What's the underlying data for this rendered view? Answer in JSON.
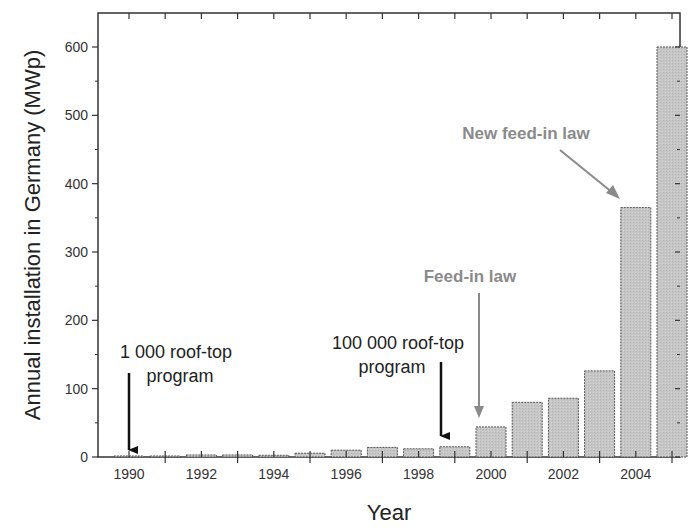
{
  "chart_data": {
    "type": "bar",
    "title": "",
    "xlabel": "Year",
    "ylabel": "Annual installation in Germany (MWp)",
    "categories": [
      "1990",
      "1991",
      "1992",
      "1993",
      "1994",
      "1995",
      "1996",
      "1997",
      "1998",
      "1999",
      "2000",
      "2001",
      "2002",
      "2003",
      "2004",
      "2005"
    ],
    "values": [
      0.5,
      1.5,
      3,
      3,
      2.5,
      5.5,
      10,
      14,
      12,
      15,
      44,
      80,
      86,
      126,
      365,
      600
    ],
    "xticks": [
      "1990",
      "1992",
      "1994",
      "1996",
      "1998",
      "2000",
      "2002",
      "2004"
    ],
    "yticks": [
      0,
      100,
      200,
      300,
      400,
      500,
      600
    ],
    "ylim": [
      0,
      650
    ],
    "grid": false,
    "legend": null,
    "annotations": [
      {
        "text_lines": [
          "1 000 roof-top",
          "program"
        ],
        "target_year": "1990",
        "color": "#222222"
      },
      {
        "text_lines": [
          "100 000 roof-top",
          "program"
        ],
        "target_year": "1999",
        "color": "#222222"
      },
      {
        "text_lines": [
          "Feed-in law"
        ],
        "target_year": "2000",
        "color": "#8a8a8a"
      },
      {
        "text_lines": [
          "New feed-in law"
        ],
        "target_year": "2004",
        "color": "#8a8a8a"
      }
    ],
    "colors": {
      "bar_fill": "#c4c4c4",
      "bar_stroke": "#555555",
      "axis": "#333333",
      "grey_annotation": "#8a8a8a"
    }
  }
}
